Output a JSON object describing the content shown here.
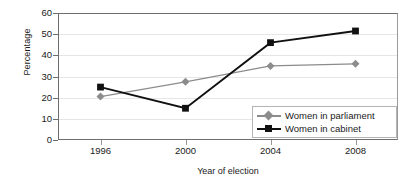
{
  "chart_data": {
    "type": "line",
    "title": "",
    "xlabel": "Year of election",
    "ylabel": "Percentage",
    "categories": [
      "1996",
      "2000",
      "2004",
      "2008"
    ],
    "x": [
      1996,
      2000,
      2004,
      2008
    ],
    "ylim": [
      0,
      60
    ],
    "ytick_labels": [
      "60",
      "50",
      "40",
      "30",
      "20",
      "10",
      "0"
    ],
    "ytick_values": [
      60,
      50,
      40,
      30,
      20,
      10,
      0
    ],
    "grid": true,
    "legend_position": "lower right",
    "series": [
      {
        "name": "Women in parliament",
        "values": [
          20.5,
          27.5,
          35,
          36
        ],
        "color": "#8c8c8c",
        "marker": "diamond"
      },
      {
        "name": "Women in cabinet",
        "values": [
          25,
          15,
          46,
          51.5
        ],
        "color": "#111111",
        "marker": "square"
      }
    ]
  },
  "axes": {
    "y_title": "Percentage",
    "x_title": "Year of election"
  },
  "legend": {
    "items": [
      {
        "label": "Women in parliament",
        "marker": "diamond-marker-icon"
      },
      {
        "label": "Women in cabinet",
        "marker": "square-marker-icon"
      }
    ]
  }
}
